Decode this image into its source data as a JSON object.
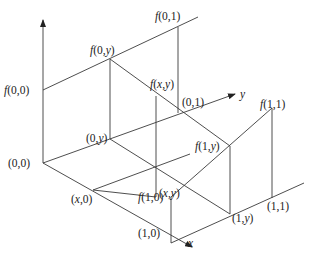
{
  "diagram": {
    "axes": {
      "x_label": "x",
      "y_label": "y"
    },
    "labels": {
      "f00": {
        "f": "f",
        "args": "(0,0)"
      },
      "f0y": {
        "f": "f",
        "pre": "(0,",
        "y": "y",
        "post": ")"
      },
      "f01": {
        "f": "f",
        "args": "(0,1)"
      },
      "fxy": {
        "f": "f",
        "pre": "(",
        "x": "x",
        "mid": ",",
        "y": "y",
        "post": ")"
      },
      "f1y": {
        "f": "f",
        "pre": "(1,",
        "y": "y",
        "post": ")"
      },
      "f11": {
        "f": "f",
        "args": "(1,1)"
      },
      "f10": {
        "f": "f",
        "args": "(1,0)"
      },
      "p00": "(0,0)",
      "p0y": {
        "pre": "(0,",
        "y": "y",
        "post": ")"
      },
      "p01": "(0,1)",
      "pxy": {
        "pre": "(",
        "x": "x",
        "mid": ",",
        "y": "y",
        "post": ")"
      },
      "px0": {
        "pre": "(",
        "x": "x",
        "post": ",0)"
      },
      "p10": "(1,0)",
      "p1y": {
        "pre": "(1,",
        "y": "y",
        "post": ")"
      },
      "p11": "(1,1)"
    }
  }
}
